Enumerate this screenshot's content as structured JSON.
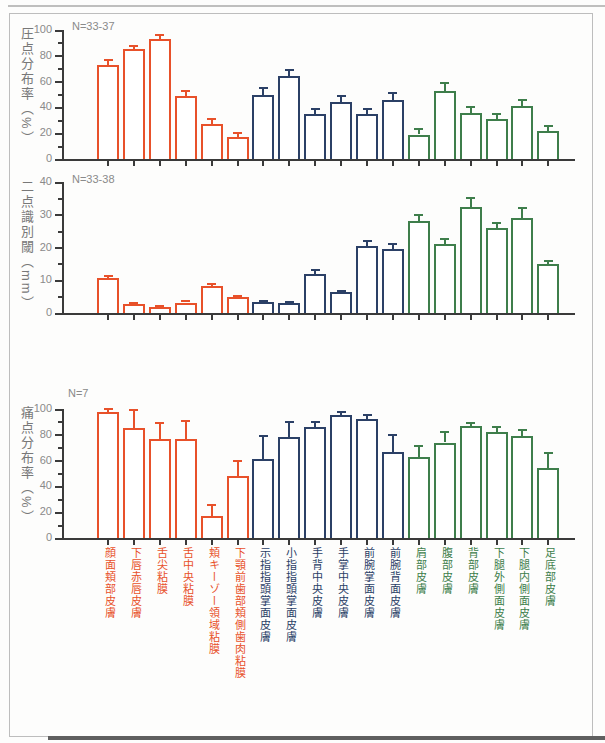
{
  "colors": {
    "oral_group": "#e8512a",
    "hand_group": "#2b4066",
    "body_group": "#3e7e4b",
    "axis": "#3a3a3a",
    "muted_text": "#8a8a8a",
    "ylabel_text": "#787878",
    "frame_border": "#bdbdbd",
    "scan_edge_top": "#a9a9a9",
    "scan_edge_bottom": "#5f5f5f",
    "bar_fill": "#ffffff"
  },
  "category_groups": [
    "oral",
    "oral",
    "oral",
    "oral",
    "oral",
    "oral",
    "hand",
    "hand",
    "hand",
    "hand",
    "hand",
    "hand",
    "body",
    "body",
    "body",
    "body",
    "body",
    "body"
  ],
  "chart_data": [
    {
      "type": "bar",
      "id": "pressure-point-distribution",
      "title": "",
      "ylabel": "圧点分布率（%）",
      "xlabel": "",
      "n_label": "N=33-37",
      "ylim": [
        0,
        100
      ],
      "yticks": [
        0,
        20,
        40,
        60,
        80,
        100
      ],
      "ytick_minor_step": 10,
      "grid": false,
      "legend": false,
      "categories": [
        "顔面頬部皮膚",
        "下唇赤唇皮膚",
        "舌尖粘膜",
        "舌中央粘膜",
        "頬キーゾー領域粘膜",
        "下顎前歯部頬側歯肉粘膜",
        "示指指頭掌面皮膚",
        "小指指頭掌面皮膚",
        "手背中央皮膚",
        "手掌中央皮膚",
        "前腕掌面皮膚",
        "前腕背面皮膚",
        "肩部皮膚",
        "腹部皮膚",
        "背部皮膚",
        "下腿外側面皮膚",
        "下腿内側面皮膚",
        "足底部皮膚"
      ],
      "values": [
        73,
        85,
        93,
        49,
        27,
        17,
        50,
        64,
        35,
        44,
        35,
        46,
        19,
        53,
        36,
        31,
        41,
        22
      ],
      "errors_plus": [
        4,
        3,
        3,
        4,
        4,
        3,
        5,
        5,
        4,
        5,
        4,
        5,
        4,
        6,
        4,
        4,
        5,
        4
      ]
    },
    {
      "type": "bar",
      "id": "two-point-discrimination-threshold",
      "title": "",
      "ylabel": "二点識別閾（mm）",
      "xlabel": "",
      "n_label": "N=33-38",
      "ylim": [
        0,
        40
      ],
      "yticks": [
        0,
        10,
        20,
        30,
        40
      ],
      "ytick_minor_step": 5,
      "grid": false,
      "legend": false,
      "categories": [
        "顔面頬部皮膚",
        "下唇赤唇皮膚",
        "舌尖粘膜",
        "舌中央粘膜",
        "頬キーゾー領域粘膜",
        "下顎前歯部頬側歯肉粘膜",
        "示指指頭掌面皮膚",
        "小指指頭掌面皮膚",
        "手背中央皮膚",
        "手掌中央皮膚",
        "前腕掌面皮膚",
        "前腕背面皮膚",
        "肩部皮膚",
        "腹部皮膚",
        "背部皮膚",
        "下腿外側面皮膚",
        "下腿内側面皮膚",
        "足底部皮膚"
      ],
      "values": [
        10.8,
        2.7,
        1.8,
        3.2,
        8.2,
        4.8,
        3.4,
        3.0,
        12.0,
        6.3,
        20.5,
        19.5,
        28.0,
        21.0,
        32.5,
        26.0,
        29.0,
        15.0
      ],
      "errors_plus": [
        0.5,
        0.3,
        0.3,
        0.4,
        0.6,
        0.5,
        0.4,
        0.3,
        1.0,
        0.5,
        1.5,
        1.5,
        2.0,
        1.5,
        2.5,
        1.5,
        3.0,
        1.0
      ]
    },
    {
      "type": "bar",
      "id": "pain-point-distribution",
      "title": "",
      "ylabel": "痛点分布率（%）",
      "xlabel": "",
      "n_label": "N=7",
      "ylim": [
        0,
        100
      ],
      "yticks": [
        0,
        20,
        40,
        60,
        80,
        100
      ],
      "ytick_minor_step": 10,
      "grid": false,
      "legend": false,
      "categories": [
        "顔面頬部皮膚",
        "下唇赤唇皮膚",
        "舌尖粘膜",
        "舌中央粘膜",
        "頬キーゾー領域粘膜",
        "下顎前歯部頬側歯肉粘膜",
        "示指指頭掌面皮膚",
        "小指指頭掌面皮膚",
        "手背中央皮膚",
        "手掌中央皮膚",
        "前腕掌面皮膚",
        "前腕背面皮膚",
        "肩部皮膚",
        "腹部皮膚",
        "背部皮膚",
        "下腿外側面皮膚",
        "下腿内側面皮膚",
        "足底部皮膚"
      ],
      "values": [
        98,
        85,
        77,
        77,
        17,
        48,
        61,
        78,
        86,
        95,
        92,
        67,
        63,
        74,
        87,
        82,
        79,
        54
      ],
      "errors_plus": [
        2,
        14,
        12,
        14,
        9,
        12,
        18,
        12,
        4,
        3,
        3,
        13,
        8,
        8,
        2,
        4,
        5,
        12
      ]
    }
  ]
}
